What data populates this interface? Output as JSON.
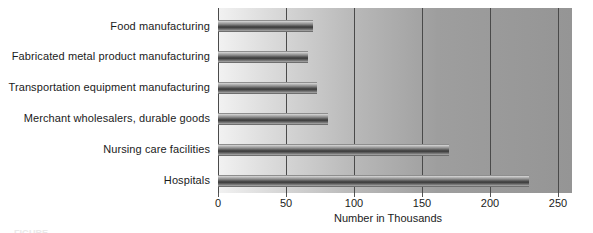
{
  "chart_data": {
    "type": "bar",
    "orientation": "horizontal",
    "title": "",
    "xlabel": "Number in Thousands",
    "ylabel": "",
    "xlim": [
      0,
      250
    ],
    "xticks": [
      0,
      50,
      100,
      150,
      200,
      250
    ],
    "xtick_labels": [
      "0",
      "50",
      "100",
      "150",
      "200",
      "250"
    ],
    "grid": true,
    "grid_axis": "x",
    "legend": false,
    "categories": [
      "Food manufacturing",
      "Fabricated metal product manufacturing",
      "Transportation equipment manufacturing",
      "Merchant wholesalers, durable goods",
      "Nursing care facilities",
      "Hospitals"
    ],
    "values": [
      70,
      66,
      73,
      81,
      170,
      229
    ],
    "colors": {
      "bar_dark": "#3a3a3a",
      "bar_light": "#d9d9d9",
      "plot_background_left": "#f2f2f2",
      "plot_background_right": "#959595",
      "gridline": "#4a4a4a",
      "text": "#1b1b1b"
    }
  },
  "caption_sliver": "FIGURE"
}
